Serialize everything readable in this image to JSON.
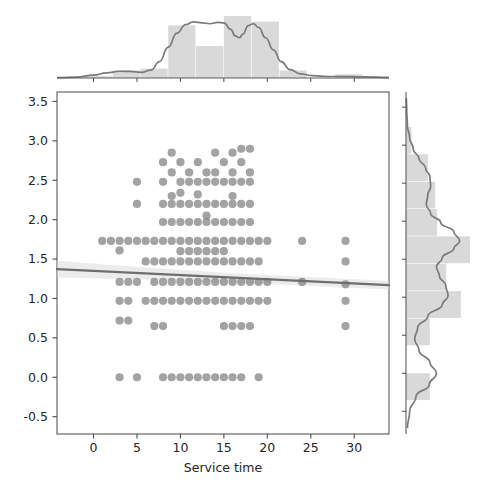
{
  "figure": {
    "kind": "jointplot",
    "background": "#ffffff",
    "width": 482,
    "height": 493
  },
  "style": {
    "point_color": "#7f7f7f",
    "point_opacity": 0.72,
    "point_radius": 4.1,
    "line_color": "#6e6e6e",
    "band_color": "#d9d9d9",
    "hist_fill": "#d9d9d9",
    "kde_color": "#7a7a7a",
    "axis_color": "#5a5a5a",
    "tick_color": "#4d4d4d",
    "text_color": "#262626"
  },
  "chart_data": {
    "type": "scatter",
    "title": "",
    "subtitle": "",
    "xlabel": "Service time",
    "ylabel": "",
    "xlim": [
      -4.2,
      34.0
    ],
    "ylim": [
      -0.72,
      3.62
    ],
    "grid": false,
    "legend": null,
    "xticks": [
      0,
      5,
      10,
      15,
      20,
      25,
      30
    ],
    "xticklabels": [
      "0",
      "5",
      "10",
      "15",
      "20",
      "25",
      "30"
    ],
    "yticks": [
      -0.5,
      0.0,
      0.5,
      1.0,
      1.5,
      2.0,
      2.5,
      3.0,
      3.5
    ],
    "yticklabels": [
      "-0.5",
      "0.0",
      "0.5",
      "1.0",
      "1.5",
      "2.0",
      "2.5",
      "3.0",
      "3.5"
    ],
    "regression": {
      "shown": true,
      "x0": -4.2,
      "y0": 1.372,
      "x1": 34.0,
      "y1": 1.168,
      "ci_band": true,
      "ci_half_width_left": 0.105,
      "ci_half_width_right": 0.055
    },
    "points": [
      [
        1,
        1.73
      ],
      [
        2,
        1.73
      ],
      [
        3,
        1.73
      ],
      [
        3,
        1.61
      ],
      [
        3,
        1.21
      ],
      [
        3,
        0.97
      ],
      [
        3,
        0.72
      ],
      [
        3,
        0.0
      ],
      [
        4,
        1.73
      ],
      [
        4,
        1.21
      ],
      [
        4,
        0.97
      ],
      [
        4,
        0.72
      ],
      [
        5,
        2.48
      ],
      [
        5,
        2.2
      ],
      [
        5,
        1.73
      ],
      [
        5,
        1.21
      ],
      [
        5,
        0.0
      ],
      [
        6,
        1.73
      ],
      [
        6,
        1.47
      ],
      [
        6,
        0.97
      ],
      [
        7,
        1.73
      ],
      [
        7,
        1.47
      ],
      [
        7,
        1.21
      ],
      [
        7,
        0.97
      ],
      [
        7,
        0.65
      ],
      [
        8,
        2.73
      ],
      [
        8,
        2.48
      ],
      [
        8,
        2.2
      ],
      [
        8,
        1.97
      ],
      [
        8,
        1.73
      ],
      [
        8,
        1.47
      ],
      [
        8,
        1.21
      ],
      [
        8,
        0.97
      ],
      [
        8,
        0.65
      ],
      [
        8,
        0.0
      ],
      [
        9,
        2.85
      ],
      [
        9,
        2.6
      ],
      [
        9,
        2.3
      ],
      [
        9,
        2.2
      ],
      [
        9,
        1.97
      ],
      [
        9,
        1.73
      ],
      [
        9,
        1.47
      ],
      [
        9,
        1.21
      ],
      [
        9,
        0.97
      ],
      [
        9,
        0.0
      ],
      [
        10,
        2.73
      ],
      [
        10,
        2.48
      ],
      [
        10,
        2.34
      ],
      [
        10,
        2.2
      ],
      [
        10,
        1.97
      ],
      [
        10,
        1.73
      ],
      [
        10,
        1.6
      ],
      [
        10,
        1.47
      ],
      [
        10,
        1.21
      ],
      [
        10,
        0.97
      ],
      [
        10,
        0.0
      ],
      [
        11,
        2.6
      ],
      [
        11,
        2.48
      ],
      [
        11,
        2.2
      ],
      [
        11,
        1.97
      ],
      [
        11,
        1.73
      ],
      [
        11,
        1.6
      ],
      [
        11,
        1.47
      ],
      [
        11,
        1.21
      ],
      [
        11,
        0.97
      ],
      [
        11,
        0.0
      ],
      [
        12,
        2.73
      ],
      [
        12,
        2.48
      ],
      [
        12,
        2.32
      ],
      [
        12,
        2.2
      ],
      [
        12,
        1.97
      ],
      [
        12,
        1.73
      ],
      [
        12,
        1.6
      ],
      [
        12,
        1.47
      ],
      [
        12,
        1.21
      ],
      [
        12,
        0.97
      ],
      [
        12,
        0.0
      ],
      [
        13,
        2.6
      ],
      [
        13,
        2.48
      ],
      [
        13,
        2.2
      ],
      [
        13,
        2.05
      ],
      [
        13,
        1.97
      ],
      [
        13,
        1.73
      ],
      [
        13,
        1.6
      ],
      [
        13,
        1.47
      ],
      [
        13,
        1.21
      ],
      [
        13,
        0.97
      ],
      [
        13,
        0.0
      ],
      [
        14,
        2.85
      ],
      [
        14,
        2.6
      ],
      [
        14,
        2.48
      ],
      [
        14,
        2.2
      ],
      [
        14,
        1.97
      ],
      [
        14,
        1.73
      ],
      [
        14,
        1.6
      ],
      [
        14,
        1.47
      ],
      [
        14,
        1.21
      ],
      [
        14,
        0.97
      ],
      [
        14,
        0.0
      ],
      [
        15,
        2.73
      ],
      [
        15,
        2.48
      ],
      [
        15,
        2.2
      ],
      [
        15,
        1.97
      ],
      [
        15,
        1.73
      ],
      [
        15,
        1.6
      ],
      [
        15,
        1.47
      ],
      [
        15,
        1.21
      ],
      [
        15,
        0.97
      ],
      [
        15,
        0.65
      ],
      [
        15,
        0.0
      ],
      [
        16,
        2.85
      ],
      [
        16,
        2.6
      ],
      [
        16,
        2.48
      ],
      [
        16,
        2.3
      ],
      [
        16,
        2.2
      ],
      [
        16,
        1.97
      ],
      [
        16,
        1.73
      ],
      [
        16,
        1.47
      ],
      [
        16,
        1.21
      ],
      [
        16,
        0.97
      ],
      [
        16,
        0.65
      ],
      [
        16,
        0.0
      ],
      [
        17,
        2.9
      ],
      [
        17,
        2.73
      ],
      [
        17,
        2.48
      ],
      [
        17,
        2.2
      ],
      [
        17,
        1.97
      ],
      [
        17,
        1.73
      ],
      [
        17,
        1.47
      ],
      [
        17,
        1.21
      ],
      [
        17,
        0.97
      ],
      [
        17,
        0.65
      ],
      [
        17,
        0.0
      ],
      [
        18,
        2.9
      ],
      [
        18,
        2.6
      ],
      [
        18,
        2.48
      ],
      [
        18,
        2.2
      ],
      [
        18,
        1.97
      ],
      [
        18,
        1.73
      ],
      [
        18,
        1.47
      ],
      [
        18,
        1.21
      ],
      [
        18,
        0.97
      ],
      [
        18,
        0.65
      ],
      [
        19,
        1.73
      ],
      [
        19,
        1.47
      ],
      [
        19,
        1.21
      ],
      [
        19,
        0.97
      ],
      [
        19,
        0.0
      ],
      [
        20,
        1.73
      ],
      [
        20,
        1.21
      ],
      [
        20,
        0.97
      ],
      [
        24,
        1.73
      ],
      [
        24,
        1.21
      ],
      [
        29,
        1.73
      ],
      [
        29,
        1.47
      ],
      [
        29,
        1.18
      ],
      [
        29,
        0.97
      ],
      [
        29,
        0.65
      ]
    ],
    "marginal_x": {
      "type": "histogram+kde",
      "orientation": "vertical",
      "bin_edges": [
        -4.2,
        -1.0,
        2.2,
        5.4,
        8.6,
        11.8,
        15.0,
        18.2,
        21.4,
        24.6,
        27.8,
        31.0,
        34.0
      ],
      "counts": [
        0,
        1,
        4,
        5,
        28,
        17,
        33,
        30,
        4,
        0,
        2,
        0
      ],
      "counts_max": 33,
      "kde_peak_positions": [
        3.2,
        11.5,
        17.6
      ],
      "kde_values": [
        [
          -4.2,
          0.004
        ],
        [
          -2.0,
          0.01
        ],
        [
          0.0,
          0.03
        ],
        [
          1.5,
          0.055
        ],
        [
          3.0,
          0.072
        ],
        [
          4.2,
          0.07
        ],
        [
          5.5,
          0.06
        ],
        [
          6.6,
          0.085
        ],
        [
          7.6,
          0.175
        ],
        [
          8.6,
          0.33
        ],
        [
          9.6,
          0.48
        ],
        [
          10.6,
          0.57
        ],
        [
          11.5,
          0.6
        ],
        [
          12.5,
          0.59
        ],
        [
          13.4,
          0.58
        ],
        [
          14.3,
          0.595
        ],
        [
          15.0,
          0.59
        ],
        [
          15.8,
          0.52
        ],
        [
          16.3,
          0.45
        ],
        [
          16.8,
          0.43
        ],
        [
          17.2,
          0.47
        ],
        [
          17.8,
          0.56
        ],
        [
          18.4,
          0.58
        ],
        [
          19.0,
          0.54
        ],
        [
          19.8,
          0.43
        ],
        [
          20.7,
          0.3
        ],
        [
          21.6,
          0.175
        ],
        [
          22.6,
          0.09
        ],
        [
          23.8,
          0.045
        ],
        [
          25.2,
          0.025
        ],
        [
          27.0,
          0.016
        ],
        [
          29.0,
          0.016
        ],
        [
          31.0,
          0.012
        ],
        [
          34.0,
          0.006
        ]
      ]
    },
    "marginal_y": {
      "type": "histogram+kde",
      "orientation": "horizontal",
      "bin_edges": [
        -0.72,
        -0.36,
        0.0,
        0.36,
        0.72,
        1.08,
        1.44,
        1.8,
        2.16,
        2.52,
        2.88,
        3.24,
        3.62
      ],
      "counts": [
        0,
        13,
        0,
        13,
        30,
        22,
        35,
        17,
        16,
        12,
        3,
        0
      ],
      "counts_max": 35,
      "kde_peak_positions": [
        0.02,
        1.0,
        1.72,
        2.45
      ],
      "kde_values": [
        [
          -0.72,
          0.02
        ],
        [
          -0.5,
          0.05
        ],
        [
          -0.3,
          0.14
        ],
        [
          -0.15,
          0.32
        ],
        [
          0.0,
          0.42
        ],
        [
          0.14,
          0.33
        ],
        [
          0.3,
          0.18
        ],
        [
          0.45,
          0.12
        ],
        [
          0.6,
          0.16
        ],
        [
          0.75,
          0.3
        ],
        [
          0.9,
          0.5
        ],
        [
          1.02,
          0.58
        ],
        [
          1.15,
          0.55
        ],
        [
          1.28,
          0.46
        ],
        [
          1.4,
          0.42
        ],
        [
          1.52,
          0.5
        ],
        [
          1.64,
          0.66
        ],
        [
          1.74,
          0.74
        ],
        [
          1.86,
          0.66
        ],
        [
          1.98,
          0.48
        ],
        [
          2.1,
          0.34
        ],
        [
          2.22,
          0.28
        ],
        [
          2.34,
          0.3
        ],
        [
          2.46,
          0.34
        ],
        [
          2.58,
          0.33
        ],
        [
          2.7,
          0.27
        ],
        [
          2.82,
          0.18
        ],
        [
          2.95,
          0.1
        ],
        [
          3.1,
          0.05
        ],
        [
          3.25,
          0.02
        ],
        [
          3.45,
          0.01
        ],
        [
          3.62,
          0.005
        ]
      ]
    }
  }
}
